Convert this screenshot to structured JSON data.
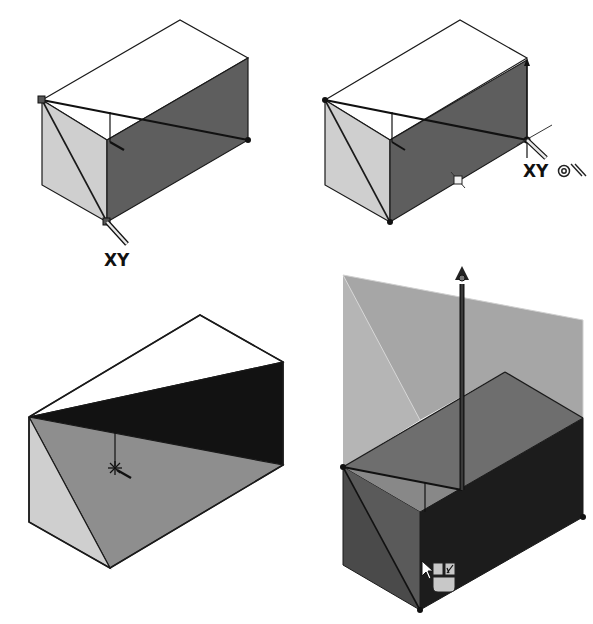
{
  "canvas": {
    "width": 593,
    "height": 624,
    "background": "#ffffff"
  },
  "colors": {
    "edge": "#1a1a1a",
    "top_face": "#ffffff",
    "left_face": "#cfcfcf",
    "right_face": "#5e5e5e",
    "black_face": "#121212",
    "mid_face": "#8e8e8e",
    "ghost_face": "#9a9a9a",
    "ghost_light": "#b8b8b8",
    "dark_left": "#4a4a4a",
    "dark_right": "#1c1c1c"
  },
  "panels": [
    {
      "id": "panel-1",
      "description": "Box with sketch line from top-left vertex to right edge, XY triad at bottom vertex",
      "faces": {
        "top": "42,100 180,20 248,58 248,140 107,222 42,100",
        "left": "42,100 107,140 107,222 42,185",
        "right": "107,140 248,58 248,140 107,222"
      },
      "top_outline": "42,100 180,20 248,58 107,140 42,100",
      "diagonal": [
        42,
        100,
        107,
        222
      ],
      "sketch_line": [
        42,
        100,
        248,
        140
      ],
      "vertical_tick": [
        110,
        112,
        110,
        142
      ],
      "pointer_arrow": [
        110,
        142,
        124,
        150
      ],
      "vertex_square": [
        39,
        97
      ],
      "vertex_dot": [
        248,
        140
      ],
      "triad_vertex": [
        107,
        222
      ],
      "triad_handle": [
        107,
        222,
        126,
        244
      ],
      "label": {
        "text": "XY",
        "x": 104,
        "y": 264
      }
    },
    {
      "id": "panel-2",
      "description": "Box with sketch line ending at right vertex with XY triad and snap icons",
      "faces": {
        "left": "325,100 390,140 390,222 325,185",
        "right": "390,140 527,60 527,140 390,222"
      },
      "top_outline": "325,100 460,20 527,58 390,140 325,100",
      "diagonal": [
        325,
        100,
        390,
        222
      ],
      "sketch_line": [
        325,
        100,
        527,
        140
      ],
      "vertical_tick": [
        392,
        112,
        392,
        142
      ],
      "pointer_arrow": [
        392,
        142,
        405,
        150
      ],
      "right_vertical": [
        527,
        60,
        527,
        158
      ],
      "midpoint_marker": [
        458,
        180
      ],
      "vertex_dots": [
        [
          325,
          100
        ],
        [
          390,
          222
        ],
        [
          527,
          140
        ]
      ],
      "triad_handle": [
        527,
        140,
        546,
        160
      ],
      "triad_line": [
        517,
        140,
        552,
        125
      ],
      "label": {
        "text": "XY",
        "x": 524,
        "y": 176
      },
      "snap_icons": [
        "concentric-circle",
        "parallel-slash"
      ]
    },
    {
      "id": "panel-3",
      "description": "Box cut by sloped plane; dark wedge on upper right, mid-gray sloped face",
      "faces": {
        "top": "29,417 200,315 283,362 283,400 29,417",
        "black": "29,417 283,362 283,465 29,417",
        "left": "29,417 110,568 29,522",
        "slope": "29,417 283,465 110,568"
      },
      "outline": "29,417 200,315 283,362 283,465 110,568 29,522 29,417",
      "inner_edges": [
        [
          29,
          417,
          283,
          362
        ],
        [
          29,
          417,
          283,
          465
        ],
        [
          29,
          417,
          110,
          568
        ]
      ],
      "vertical_tick": [
        115,
        432,
        115,
        468
      ],
      "star_marker": [
        115,
        468
      ],
      "pointer_arrow": [
        115,
        468,
        130,
        478
      ]
    },
    {
      "id": "panel-4",
      "description": "Extrude preview: translucent ghost body above solid dark box with drag arrow and context toolbar",
      "faces": {
        "ghost_top": "343,275 583,320 583,418 420,512 343,460",
        "ghost_front": "343,275 420,420 420,512 343,460",
        "solid_top": "343,467 505,372 583,418 420,512 343,467",
        "solid_left": "343,467 420,512 420,610 343,565",
        "solid_right": "420,512 583,418 583,517 420,610"
      },
      "edges": [
        [
          343,
          467,
          505,
          372
        ],
        [
          505,
          372,
          583,
          418
        ],
        [
          343,
          467,
          462,
          490
        ],
        [
          343,
          467,
          420,
          610
        ],
        [
          420,
          512,
          583,
          418
        ],
        [
          420,
          610,
          583,
          517
        ]
      ],
      "arrow": {
        "x1": 462,
        "y1": 490,
        "x2": 462,
        "y2": 272
      },
      "vertex_dots": [
        [
          343,
          467
        ],
        [
          583,
          517
        ],
        [
          420,
          610
        ]
      ],
      "cursor": {
        "x": 422,
        "y": 563
      },
      "context_toolbar": {
        "buttons": [
          {
            "name": "confirm-button",
            "x": 433,
            "y": 563,
            "w": 10,
            "h": 12
          },
          {
            "name": "edit-sketch-button",
            "x": 445,
            "y": 563,
            "w": 10,
            "h": 12
          },
          {
            "name": "options-button",
            "x": 433,
            "y": 577,
            "w": 22,
            "h": 14
          }
        ]
      }
    }
  ]
}
